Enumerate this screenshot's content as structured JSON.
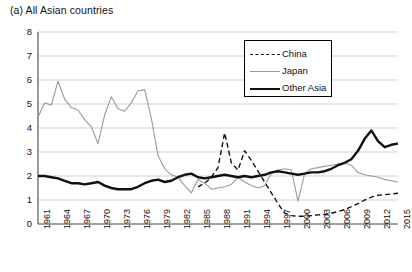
{
  "title": "(a) All Asian countries",
  "legend": {
    "position": "top-right-inside",
    "entries": [
      {
        "label": "China",
        "style": "dashed",
        "color": "#111111",
        "key": "china-legend-key"
      },
      {
        "label": "Japan",
        "style": "solid-thin",
        "color": "#9a9a9a",
        "key": "japan-legend-key"
      },
      {
        "label": "Other Asia",
        "style": "solid-thick",
        "color": "#111111",
        "key": "other-asia-legend-key"
      }
    ]
  },
  "axes": {
    "y_ticks": [
      "0",
      "1",
      "2",
      "3",
      "4",
      "5",
      "6",
      "7",
      "8"
    ],
    "x_ticks": [
      "1961",
      "1964",
      "1967",
      "1970",
      "1973",
      "1976",
      "1979",
      "1982",
      "1985",
      "1988",
      "1991",
      "1994",
      "1997",
      "2000",
      "2003",
      "2006",
      "2009",
      "2012",
      "2015"
    ]
  },
  "chart_data": {
    "type": "line",
    "title": "(a) All Asian countries",
    "xlabel": "",
    "ylabel": "",
    "xlim": [
      1961,
      2015
    ],
    "ylim": [
      0,
      8
    ],
    "ytick_step": 1,
    "xtick_step": 3,
    "grid": "horizontal",
    "legend_position": "top-right-inside",
    "x": [
      1961,
      1962,
      1963,
      1964,
      1965,
      1966,
      1967,
      1968,
      1969,
      1970,
      1971,
      1972,
      1973,
      1974,
      1975,
      1976,
      1977,
      1978,
      1979,
      1980,
      1981,
      1982,
      1983,
      1984,
      1985,
      1986,
      1987,
      1988,
      1989,
      1990,
      1991,
      1992,
      1993,
      1994,
      1995,
      1996,
      1997,
      1998,
      1999,
      2000,
      2001,
      2002,
      2003,
      2004,
      2005,
      2006,
      2007,
      2008,
      2009,
      2010,
      2011,
      2012,
      2013,
      2014,
      2015
    ],
    "series": [
      {
        "name": "China",
        "style": "dashed",
        "color": "#111111",
        "start_year": 1985,
        "values": [
          null,
          null,
          null,
          null,
          null,
          null,
          null,
          null,
          null,
          null,
          null,
          null,
          null,
          null,
          null,
          null,
          null,
          null,
          null,
          null,
          null,
          null,
          null,
          null,
          1.55,
          1.7,
          1.95,
          2.35,
          3.8,
          2.55,
          2.25,
          3.05,
          2.65,
          2.2,
          1.75,
          1.3,
          0.85,
          0.45,
          0.35,
          0.32,
          0.32,
          0.35,
          0.38,
          0.4,
          0.45,
          0.52,
          0.6,
          0.72,
          0.85,
          1.0,
          1.12,
          1.2,
          1.22,
          1.25,
          1.28
        ]
      },
      {
        "name": "Japan",
        "style": "solid-thin",
        "color": "#9a9a9a",
        "values": [
          4.45,
          5.05,
          4.95,
          5.95,
          5.2,
          4.85,
          4.75,
          4.35,
          4.05,
          3.35,
          4.55,
          5.3,
          4.8,
          4.7,
          5.05,
          5.55,
          5.6,
          4.4,
          2.85,
          2.3,
          2.05,
          1.95,
          1.6,
          1.3,
          1.85,
          1.7,
          1.45,
          1.5,
          1.55,
          1.65,
          1.95,
          1.75,
          1.6,
          1.5,
          1.6,
          2.1,
          2.25,
          2.3,
          2.25,
          0.95,
          2.1,
          2.3,
          2.35,
          2.4,
          2.45,
          2.5,
          2.55,
          2.45,
          2.15,
          2.05,
          2.0,
          1.95,
          1.85,
          1.8,
          1.75
        ]
      },
      {
        "name": "Other Asia",
        "style": "solid-thick",
        "color": "#111111",
        "values": [
          2.0,
          2.0,
          1.95,
          1.9,
          1.8,
          1.7,
          1.7,
          1.65,
          1.7,
          1.75,
          1.6,
          1.5,
          1.45,
          1.45,
          1.45,
          1.55,
          1.7,
          1.8,
          1.85,
          1.75,
          1.8,
          1.95,
          2.05,
          2.1,
          1.95,
          1.9,
          1.95,
          2.0,
          2.05,
          2.0,
          1.95,
          2.0,
          1.95,
          2.0,
          2.05,
          2.15,
          2.2,
          2.15,
          2.1,
          2.05,
          2.1,
          2.15,
          2.15,
          2.2,
          2.3,
          2.45,
          2.55,
          2.7,
          3.05,
          3.55,
          3.9,
          3.45,
          3.2,
          3.3,
          3.35
        ]
      }
    ]
  }
}
